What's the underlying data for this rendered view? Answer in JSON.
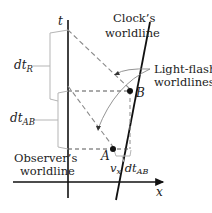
{
  "diagram": {
    "axes": {
      "t_label": "t",
      "x_label": "x"
    },
    "labels": {
      "clock_worldline": [
        "Clock’s",
        "worldline"
      ],
      "light_flash": [
        "Light-flash",
        "worldlines"
      ],
      "observer_worldline": [
        "Observer’s",
        "worldline"
      ],
      "dt_R": {
        "base": "dt",
        "sub": "R"
      },
      "dt_AB": {
        "base": "dt",
        "sub": "AB"
      },
      "vx_dt_AB": {
        "v": "v",
        "v_sub": "x",
        "dt": "dt",
        "dt_sub": "AB"
      }
    },
    "events": {
      "A": "A",
      "B": "B"
    },
    "colors": {
      "line": "#111111",
      "dashed": "#8a8a8a",
      "bracket": "#b5b5b5",
      "text": "#222222"
    }
  }
}
